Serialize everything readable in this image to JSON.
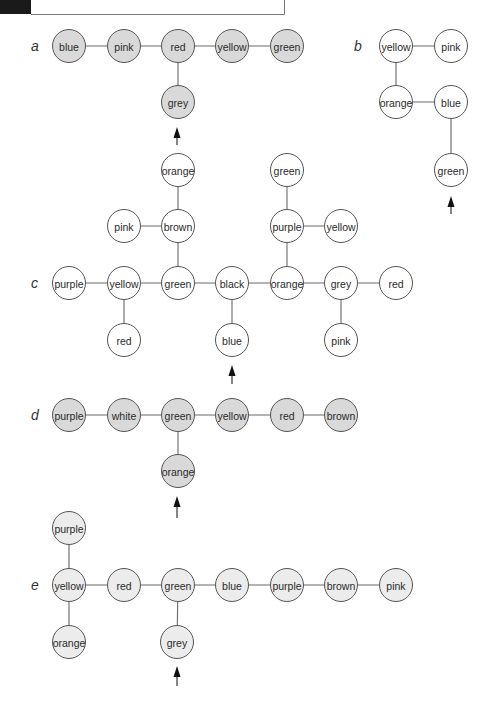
{
  "header": {
    "tab_block_color": "#1a1a1a",
    "frame_color": "#777777"
  },
  "styles": {
    "fill_dark": "#d9d9d9",
    "fill_light": "#ececec",
    "fill_white": "#ffffff"
  },
  "panels": [
    {
      "label": "a",
      "label_pos": [
        31,
        46
      ],
      "fill": "fill_dark",
      "nodes": [
        {
          "id": "a1",
          "label": "blue",
          "x": 69,
          "y": 46
        },
        {
          "id": "a2",
          "label": "pink",
          "x": 124,
          "y": 46
        },
        {
          "id": "a3",
          "label": "red",
          "x": 178,
          "y": 46
        },
        {
          "id": "a4",
          "label": "yellow",
          "x": 232,
          "y": 46
        },
        {
          "id": "a5",
          "label": "green",
          "x": 287,
          "y": 46
        },
        {
          "id": "a6",
          "label": "grey",
          "x": 178,
          "y": 102
        }
      ],
      "edges": [
        [
          "a1",
          "a2"
        ],
        [
          "a2",
          "a3"
        ],
        [
          "a3",
          "a4"
        ],
        [
          "a4",
          "a5"
        ],
        [
          "a3",
          "a6"
        ]
      ],
      "arrow": {
        "x": 177,
        "tip": 127,
        "tail": 145
      }
    },
    {
      "label": "b",
      "label_pos": [
        354,
        46
      ],
      "fill": "fill_white",
      "nodes": [
        {
          "id": "b1",
          "label": "yellow",
          "x": 396,
          "y": 46
        },
        {
          "id": "b2",
          "label": "pink",
          "x": 451,
          "y": 46
        },
        {
          "id": "b3",
          "label": "orange",
          "x": 396,
          "y": 102
        },
        {
          "id": "b4",
          "label": "blue",
          "x": 451,
          "y": 102
        },
        {
          "id": "b5",
          "label": "green",
          "x": 451,
          "y": 170
        }
      ],
      "edges": [
        [
          "b1",
          "b2"
        ],
        [
          "b1",
          "b3"
        ],
        [
          "b3",
          "b4"
        ],
        [
          "b4",
          "b5"
        ]
      ],
      "arrow": {
        "x": 451,
        "tip": 196,
        "tail": 214
      }
    },
    {
      "label": "c",
      "label_pos": [
        31,
        283
      ],
      "fill": "fill_white",
      "nodes": [
        {
          "id": "c1",
          "label": "purple",
          "x": 69,
          "y": 283
        },
        {
          "id": "c2",
          "label": "yellow",
          "x": 124,
          "y": 283
        },
        {
          "id": "c3",
          "label": "green",
          "x": 178,
          "y": 283
        },
        {
          "id": "c4",
          "label": "black",
          "x": 232,
          "y": 283
        },
        {
          "id": "c5",
          "label": "orange",
          "x": 287,
          "y": 283
        },
        {
          "id": "c6",
          "label": "grey",
          "x": 341,
          "y": 283
        },
        {
          "id": "c7",
          "label": "red",
          "x": 396,
          "y": 283
        },
        {
          "id": "c8",
          "label": "red",
          "x": 124,
          "y": 340
        },
        {
          "id": "c9",
          "label": "blue",
          "x": 232,
          "y": 340
        },
        {
          "id": "c10",
          "label": "pink",
          "x": 341,
          "y": 340
        },
        {
          "id": "c11",
          "label": "orange",
          "x": 178,
          "y": 170
        },
        {
          "id": "c12",
          "label": "brown",
          "x": 178,
          "y": 226
        },
        {
          "id": "c13",
          "label": "pink",
          "x": 124,
          "y": 226
        },
        {
          "id": "c14",
          "label": "green",
          "x": 287,
          "y": 170
        },
        {
          "id": "c15",
          "label": "purple",
          "x": 287,
          "y": 226
        },
        {
          "id": "c16",
          "label": "yellow",
          "x": 341,
          "y": 226
        }
      ],
      "edges": [
        [
          "c1",
          "c2"
        ],
        [
          "c2",
          "c3"
        ],
        [
          "c3",
          "c4"
        ],
        [
          "c4",
          "c5"
        ],
        [
          "c5",
          "c6"
        ],
        [
          "c6",
          "c7"
        ],
        [
          "c2",
          "c8"
        ],
        [
          "c4",
          "c9"
        ],
        [
          "c6",
          "c10"
        ],
        [
          "c11",
          "c12"
        ],
        [
          "c12",
          "c3"
        ],
        [
          "c13",
          "c12"
        ],
        [
          "c14",
          "c15"
        ],
        [
          "c15",
          "c5"
        ],
        [
          "c15",
          "c16"
        ]
      ],
      "arrow": {
        "x": 232,
        "tip": 365,
        "tail": 384
      }
    },
    {
      "label": "d",
      "label_pos": [
        31,
        415
      ],
      "fill": "fill_dark",
      "nodes": [
        {
          "id": "d1",
          "label": "purple",
          "x": 69,
          "y": 415
        },
        {
          "id": "d2",
          "label": "white",
          "x": 124,
          "y": 415
        },
        {
          "id": "d3",
          "label": "green",
          "x": 178,
          "y": 415
        },
        {
          "id": "d4",
          "label": "yellow",
          "x": 232,
          "y": 415
        },
        {
          "id": "d5",
          "label": "red",
          "x": 287,
          "y": 415
        },
        {
          "id": "d6",
          "label": "brown",
          "x": 341,
          "y": 415
        },
        {
          "id": "d7",
          "label": "orange",
          "x": 178,
          "y": 471
        }
      ],
      "edges": [
        [
          "d1",
          "d2"
        ],
        [
          "d2",
          "d3"
        ],
        [
          "d3",
          "d4"
        ],
        [
          "d4",
          "d5"
        ],
        [
          "d5",
          "d6"
        ],
        [
          "d3",
          "d7"
        ]
      ],
      "arrow": {
        "x": 177,
        "tip": 496,
        "tail": 518
      }
    },
    {
      "label": "e",
      "label_pos": [
        31,
        585
      ],
      "fill": "fill_light",
      "nodes": [
        {
          "id": "e1",
          "label": "purple",
          "x": 69,
          "y": 528
        },
        {
          "id": "e2",
          "label": "yellow",
          "x": 69,
          "y": 585
        },
        {
          "id": "e3",
          "label": "orange",
          "x": 69,
          "y": 642
        },
        {
          "id": "e4",
          "label": "red",
          "x": 124,
          "y": 585
        },
        {
          "id": "e5",
          "label": "green",
          "x": 178,
          "y": 585
        },
        {
          "id": "e6",
          "label": "blue",
          "x": 232,
          "y": 585
        },
        {
          "id": "e7",
          "label": "purple",
          "x": 287,
          "y": 585
        },
        {
          "id": "e8",
          "label": "brown",
          "x": 341,
          "y": 585
        },
        {
          "id": "e9",
          "label": "pink",
          "x": 396,
          "y": 585
        },
        {
          "id": "e10",
          "label": "grey",
          "x": 177,
          "y": 642
        }
      ],
      "edges": [
        [
          "e1",
          "e2"
        ],
        [
          "e2",
          "e3"
        ],
        [
          "e2",
          "e4"
        ],
        [
          "e4",
          "e5"
        ],
        [
          "e5",
          "e6"
        ],
        [
          "e6",
          "e7"
        ],
        [
          "e7",
          "e8"
        ],
        [
          "e8",
          "e9"
        ],
        [
          "e5",
          "e10"
        ]
      ],
      "arrow": {
        "x": 177,
        "tip": 666,
        "tail": 686
      }
    }
  ],
  "node_radius": 16.5
}
